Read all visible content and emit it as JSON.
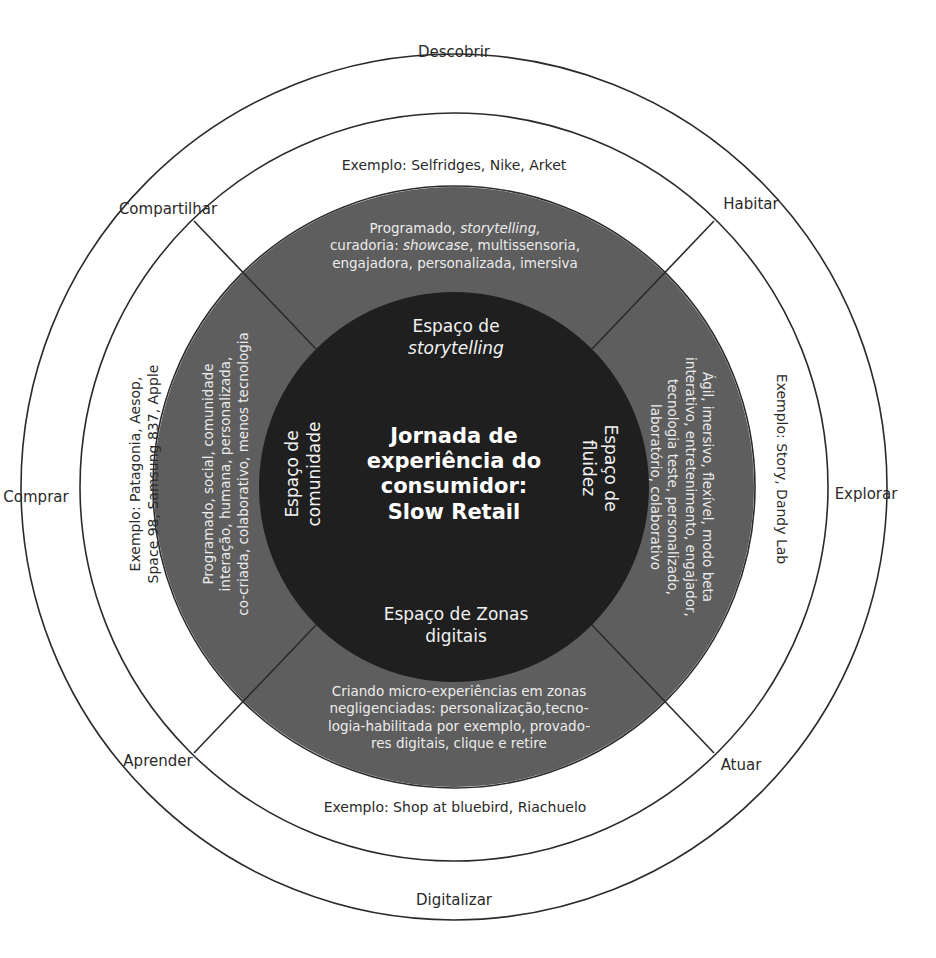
{
  "diagram": {
    "title_lines": [
      "Jornada de",
      "experiência do",
      "consumidor:",
      "Slow Retail"
    ],
    "colors": {
      "ring_gray": "#5e5e5e",
      "center_dark": "#1f1f1f",
      "line": "#2b2b2b",
      "text_dark": "#2a2a2a",
      "text_light": "#ececec"
    },
    "outer_labels": {
      "top": "Descobrir",
      "bottom": "Digitalizar",
      "left": "Comprar",
      "right": "Explorar",
      "top_left": "Compartilhar",
      "top_right": "Habitar",
      "bottom_left": "Aprender",
      "bottom_right": "Atuar"
    },
    "examples": {
      "top": "Exemplo: Selfridges, Nike, Arket",
      "bottom": "Exemplo: Shop at bluebird, Riachuelo",
      "left": [
        "Exemplo: Patagonia, Aesop,",
        "Space 98, Samsung 837, Apple"
      ],
      "right": "Exemplo: Story, Dandy Lab"
    },
    "spaces": {
      "top": {
        "line1": "Espaço de",
        "line2": "storytelling"
      },
      "bottom": {
        "line1": "Espaço de Zonas",
        "line2": "digitais"
      },
      "left": {
        "line1": "Espaço de",
        "line2": "comunidade"
      },
      "right": {
        "line1": "Espaço de",
        "line2": "fluidez"
      }
    },
    "descriptions": {
      "top": {
        "line1_a": "Programado, ",
        "line1_b": "storytelling,",
        "line2_a": "curadoria: ",
        "line2_b": "showcase",
        "line2_c": ", multissensoria,",
        "line3": "engajadora, personalizada, imersiva"
      },
      "left": [
        "Programado, social, comunidade",
        "interação, humana, personalizada,",
        "co-criada, colaborativo, menos tecnologia"
      ],
      "right": [
        "Ágil, imersivo, flexível, modo beta",
        "interativo, entretenimento, engajador,",
        "tecnologia teste, personalizado,",
        "laboratório, colaborativo"
      ],
      "bottom": [
        "Criando micro-experiências em zonas",
        "negligenciadas: personalização,tecno-",
        "logia-habilitada por exemplo, provado-",
        "res digitais, clique e retire"
      ]
    }
  }
}
